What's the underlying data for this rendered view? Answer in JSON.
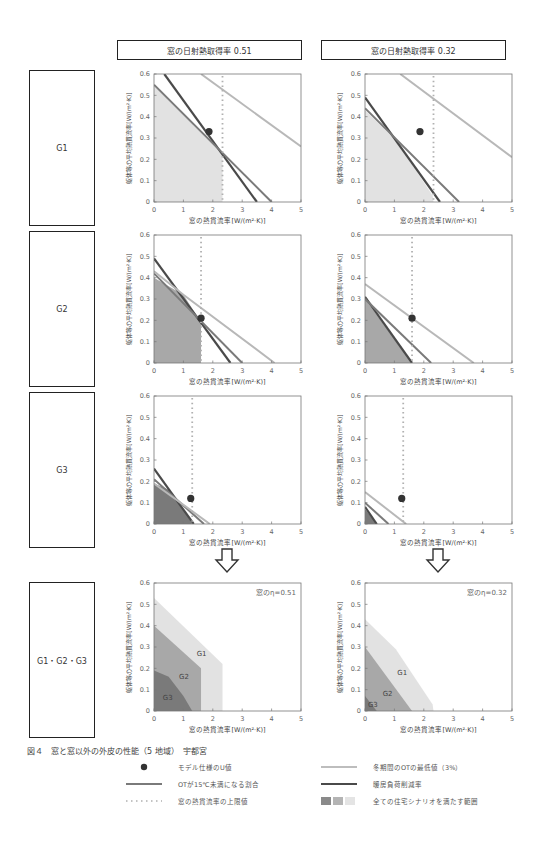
{
  "columns": [
    {
      "header": "窓の日射熱取得率  0.51",
      "eta": 0.51
    },
    {
      "header": "窓の日射熱取得率  0.32",
      "eta": 0.32
    }
  ],
  "row_labels": [
    "G1",
    "G2",
    "G3",
    "G1・G2・G3"
  ],
  "caption": "図４　窓と窓以外の外皮の性能（5 地域）　宇都宮",
  "legend": [
    {
      "symbol": "dot",
      "label": "モデル仕様のU値"
    },
    {
      "symbol": "mid-line",
      "label": "OTが15℃未満になる割合"
    },
    {
      "symbol": "dotted-line",
      "label": "窓の熱貫流率の上限値"
    },
    {
      "symbol": "light-line",
      "label": "冬期間のOTの最低値（3%）"
    },
    {
      "symbol": "dark-line",
      "label": "暖房負荷削減率"
    },
    {
      "symbol": "area-swatches",
      "label": "全ての住宅シナリオを満たす範囲"
    }
  ],
  "colors": {
    "dark_line": "#4a4a4a",
    "mid_line": "#7a7a7a",
    "light_line": "#b8b8b8",
    "dotted": "#b0b0b0",
    "fill_g1": "#e2e2e2",
    "fill_g2": "#a8a8a8",
    "fill_g3": "#7a7a7a",
    "dot": "#333333"
  },
  "chart_data": [
    {
      "type": "line",
      "id": "G1-0.51",
      "row": "G1",
      "eta": 0.51,
      "xlabel": "窓の熱貫流率[W/(m²·K)]",
      "ylabel": "躯体等の平均熱貫流率[W/(m²·K)]",
      "xlim": [
        0,
        5
      ],
      "ylim": [
        0,
        0.6
      ],
      "xticks": [
        "0",
        "1",
        "2",
        "3",
        "4",
        "5"
      ],
      "yticks": [
        "0",
        "0.1",
        "0.2",
        "0.3",
        "0.4",
        "0.5",
        "0.6"
      ],
      "series": [
        {
          "name": "暖房負荷削減率",
          "style": "dark",
          "points": [
            [
              0.35,
              0.6
            ],
            [
              3.5,
              0
            ]
          ]
        },
        {
          "name": "OTが15℃未満になる割合",
          "style": "mid",
          "points": [
            [
              0,
              0.55
            ],
            [
              4.0,
              0
            ]
          ]
        },
        {
          "name": "冬期間のOTの最低値（3%）",
          "style": "light",
          "points": [
            [
              1.6,
              0.6
            ],
            [
              5,
              0.26
            ]
          ]
        },
        {
          "name": "窓の熱貫流率の上限値",
          "style": "dotted",
          "x": 2.33
        }
      ],
      "fill": {
        "shade": "fill_g1",
        "polygon": [
          [
            0,
            0
          ],
          [
            0,
            0.55
          ],
          [
            2.33,
            0.23
          ],
          [
            2.33,
            0
          ]
        ]
      },
      "model_point": [
        1.87,
        0.33
      ]
    },
    {
      "type": "line",
      "id": "G1-0.32",
      "row": "G1",
      "eta": 0.32,
      "xlabel": "窓の熱貫流率[W/(m²·K)]",
      "ylabel": "躯体等の平均熱貫流率[W/(m²·K)]",
      "xlim": [
        0,
        5
      ],
      "ylim": [
        0,
        0.6
      ],
      "xticks": [
        "0",
        "1",
        "2",
        "3",
        "4",
        "5"
      ],
      "yticks": [
        "0",
        "0.1",
        "0.2",
        "0.3",
        "0.4",
        "0.5",
        "0.6"
      ],
      "series": [
        {
          "name": "暖房負荷削減率",
          "style": "dark",
          "points": [
            [
              0,
              0.49
            ],
            [
              2.55,
              0
            ]
          ]
        },
        {
          "name": "OTが15℃未満になる割合",
          "style": "mid",
          "points": [
            [
              0,
              0.44
            ],
            [
              3.2,
              0
            ]
          ]
        },
        {
          "name": "冬期間のOTの最低値（3%）",
          "style": "light",
          "points": [
            [
              1.2,
              0.6
            ],
            [
              5,
              0.21
            ]
          ]
        },
        {
          "name": "窓の熱貫流率の上限値",
          "style": "dotted",
          "x": 2.33
        }
      ],
      "fill": {
        "shade": "fill_g1",
        "polygon": [
          [
            0,
            0
          ],
          [
            0,
            0.43
          ],
          [
            1.05,
            0.29
          ],
          [
            2.3,
            0.03
          ],
          [
            2.33,
            0
          ]
        ]
      },
      "model_point": [
        1.87,
        0.33
      ]
    },
    {
      "type": "line",
      "id": "G2-0.51",
      "row": "G2",
      "eta": 0.51,
      "xlabel": "窓の熱貫流率[W/(m²·K)]",
      "ylabel": "躯体等の平均熱貫流率[W/(m²·K)]",
      "xlim": [
        0,
        5
      ],
      "ylim": [
        0,
        0.6
      ],
      "xticks": [
        "0",
        "1",
        "2",
        "3",
        "4",
        "5"
      ],
      "yticks": [
        "0",
        "0.1",
        "0.2",
        "0.3",
        "0.4",
        "0.5",
        "0.6"
      ],
      "series": [
        {
          "name": "暖房負荷削減率",
          "style": "dark",
          "points": [
            [
              0,
              0.49
            ],
            [
              2.6,
              0
            ]
          ]
        },
        {
          "name": "OTが15℃未満になる割合",
          "style": "mid",
          "points": [
            [
              0,
              0.42
            ],
            [
              3.0,
              0
            ]
          ]
        },
        {
          "name": "冬期間のOTの最低値（3%）",
          "style": "light",
          "points": [
            [
              0,
              0.43
            ],
            [
              1.0,
              0.32
            ],
            [
              4.1,
              0
            ]
          ]
        },
        {
          "name": "窓の熱貫流率の上限値",
          "style": "dotted",
          "x": 1.6
        }
      ],
      "fill": {
        "shade": "fill_g2",
        "polygon": [
          [
            0,
            0
          ],
          [
            0,
            0.4
          ],
          [
            1.0,
            0.32
          ],
          [
            1.6,
            0.19
          ],
          [
            1.6,
            0
          ]
        ]
      },
      "model_point": [
        1.6,
        0.21
      ]
    },
    {
      "type": "line",
      "id": "G2-0.32",
      "row": "G2",
      "eta": 0.32,
      "xlabel": "窓の熱貫流率[W/(m²·K)]",
      "ylabel": "躯体等の平均熱貫流率[W/(m²·K)]",
      "xlim": [
        0,
        5
      ],
      "ylim": [
        0,
        0.6
      ],
      "xticks": [
        "0",
        "1",
        "2",
        "3",
        "4",
        "5"
      ],
      "yticks": [
        "0",
        "0.1",
        "0.2",
        "0.3",
        "0.4",
        "0.5",
        "0.6"
      ],
      "series": [
        {
          "name": "暖房負荷削減率",
          "style": "dark",
          "points": [
            [
              0,
              0.31
            ],
            [
              1.6,
              0
            ]
          ]
        },
        {
          "name": "OTが15℃未満になる割合",
          "style": "mid",
          "points": [
            [
              0,
              0.3
            ],
            [
              2.25,
              0
            ]
          ]
        },
        {
          "name": "冬期間のOTの最低値（3%）",
          "style": "light",
          "points": [
            [
              0,
              0.37
            ],
            [
              3.7,
              0
            ]
          ]
        },
        {
          "name": "窓の熱貫流率の上限値",
          "style": "dotted",
          "x": 1.6
        }
      ],
      "fill": {
        "shade": "fill_g2",
        "polygon": [
          [
            0,
            0
          ],
          [
            0,
            0.3
          ],
          [
            1.6,
            0
          ]
        ]
      },
      "model_point": [
        1.6,
        0.21
      ]
    },
    {
      "type": "line",
      "id": "G3-0.51",
      "row": "G3",
      "eta": 0.51,
      "xlabel": "窓の熱貫流率[W/(m²·K)]",
      "ylabel": "躯体等の平均熱貫流率[W/(m²·K)]",
      "xlim": [
        0,
        5
      ],
      "ylim": [
        0,
        0.6
      ],
      "xticks": [
        "0",
        "1",
        "2",
        "3",
        "4",
        "5"
      ],
      "yticks": [
        "0",
        "0.1",
        "0.2",
        "0.3",
        "0.4",
        "0.5",
        "0.6"
      ],
      "series": [
        {
          "name": "暖房負荷削減率",
          "style": "dark",
          "points": [
            [
              0,
              0.26
            ],
            [
              1.35,
              0
            ]
          ]
        },
        {
          "name": "OTが15℃未満になる割合",
          "style": "mid",
          "points": [
            [
              0,
              0.21
            ],
            [
              1.7,
              0
            ]
          ]
        },
        {
          "name": "冬期間のOTの最低値（3%）",
          "style": "light",
          "points": [
            [
              0,
              0.19
            ],
            [
              1.9,
              0
            ]
          ]
        },
        {
          "name": "窓の熱貫流率の上限値",
          "style": "dotted",
          "x": 1.3
        }
      ],
      "fill": {
        "shade": "fill_g3",
        "polygon": [
          [
            0,
            0
          ],
          [
            0,
            0.19
          ],
          [
            0.5,
            0.16
          ],
          [
            1.0,
            0.07
          ],
          [
            1.3,
            0
          ]
        ]
      },
      "model_point": [
        1.25,
        0.12
      ]
    },
    {
      "type": "line",
      "id": "G3-0.32",
      "row": "G3",
      "eta": 0.32,
      "xlabel": "窓の熱貫流率[W/(m²·K)]",
      "ylabel": "躯体等の平均熱貫流率[W/(m²·K)]",
      "xlim": [
        0,
        5
      ],
      "ylim": [
        0,
        0.6
      ],
      "xticks": [
        "0",
        "1",
        "2",
        "3",
        "4",
        "5"
      ],
      "yticks": [
        "0",
        "0.1",
        "0.2",
        "0.3",
        "0.4",
        "0.5",
        "0.6"
      ],
      "series": [
        {
          "name": "暖房負荷削減率",
          "style": "dark",
          "points": [
            [
              0,
              0.08
            ],
            [
              0.4,
              0
            ]
          ]
        },
        {
          "name": "OTが15℃未満になる割合",
          "style": "mid",
          "points": [
            [
              0,
              0.1
            ],
            [
              0.8,
              0
            ]
          ]
        },
        {
          "name": "冬期間のOTの最低値（3%）",
          "style": "light",
          "points": [
            [
              0,
              0.15
            ],
            [
              1.4,
              0
            ]
          ]
        },
        {
          "name": "窓の熱貫流率の上限値",
          "style": "dotted",
          "x": 1.3
        }
      ],
      "fill": {
        "shade": "fill_g3",
        "polygon": [
          [
            0,
            0
          ],
          [
            0,
            0.07
          ],
          [
            0.4,
            0
          ]
        ]
      },
      "model_point": [
        1.25,
        0.12
      ]
    },
    {
      "type": "area",
      "id": "ALL-0.51",
      "row": "G1・G2・G3",
      "eta": 0.51,
      "annotation": "窓のη=0.51",
      "xlabel": "窓の熱貫流率[W/(m²·K)]",
      "ylabel": "躯体等の平均熱貫流率[W/(m²·K)]",
      "xlim": [
        0,
        5
      ],
      "ylim": [
        0,
        0.6
      ],
      "xticks": [
        "0",
        "1",
        "2",
        "3",
        "4",
        "5"
      ],
      "yticks": [
        "0",
        "0.1",
        "0.2",
        "0.3",
        "0.4",
        "0.5",
        "0.6"
      ],
      "regions": [
        {
          "name": "G1",
          "shade": "fill_g1",
          "label_at": [
            1.45,
            0.26
          ],
          "polygon": [
            [
              0,
              0
            ],
            [
              0,
              0.53
            ],
            [
              2.33,
              0.22
            ],
            [
              2.33,
              0
            ]
          ]
        },
        {
          "name": "G2",
          "shade": "fill_g2",
          "label_at": [
            0.85,
            0.15
          ],
          "polygon": [
            [
              0,
              0
            ],
            [
              0,
              0.4
            ],
            [
              1.6,
              0.2
            ],
            [
              1.6,
              0
            ]
          ]
        },
        {
          "name": "G3",
          "shade": "fill_g3",
          "label_at": [
            0.3,
            0.05
          ],
          "polygon": [
            [
              0,
              0
            ],
            [
              0,
              0.19
            ],
            [
              0.5,
              0.16
            ],
            [
              1.0,
              0.07
            ],
            [
              1.3,
              0
            ]
          ]
        }
      ]
    },
    {
      "type": "area",
      "id": "ALL-0.32",
      "row": "G1・G2・G3",
      "eta": 0.32,
      "annotation": "窓のη=0.32",
      "xlabel": "窓の熱貫流率[W/(m²·K)]",
      "ylabel": "躯体等の平均熱貫流率[W/(m²·K)]",
      "xlim": [
        0,
        5
      ],
      "ylim": [
        0,
        0.6
      ],
      "xticks": [
        "0",
        "1",
        "2",
        "3",
        "4",
        "5"
      ],
      "yticks": [
        "0",
        "0.1",
        "0.2",
        "0.3",
        "0.4",
        "0.5",
        "0.6"
      ],
      "regions": [
        {
          "name": "G1",
          "shade": "fill_g1",
          "label_at": [
            1.1,
            0.17
          ],
          "polygon": [
            [
              0,
              0
            ],
            [
              0,
              0.43
            ],
            [
              1.05,
              0.29
            ],
            [
              2.3,
              0.03
            ],
            [
              2.33,
              0
            ]
          ]
        },
        {
          "name": "G2",
          "shade": "fill_g2",
          "label_at": [
            0.6,
            0.07
          ],
          "polygon": [
            [
              0,
              0
            ],
            [
              0,
              0.3
            ],
            [
              1.6,
              0
            ]
          ]
        },
        {
          "name": "G3",
          "shade": "fill_g3",
          "label_at": [
            0.1,
            0.02
          ],
          "polygon": [
            [
              0,
              0
            ],
            [
              0,
              0.07
            ],
            [
              0.4,
              0
            ]
          ]
        }
      ]
    }
  ]
}
